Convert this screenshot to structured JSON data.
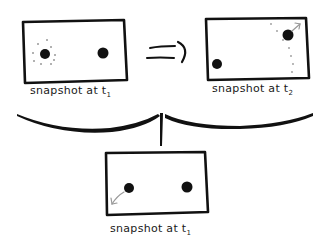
{
  "diagram": {
    "panels": [
      {
        "id": "top-left",
        "label_prefix": "snapshot at t",
        "label_subscript": "1",
        "description": "two dots; left dot surrounded by a dotted circle of possible positions"
      },
      {
        "id": "top-right",
        "label_prefix": "snapshot at t",
        "label_subscript": "2",
        "description": "one dot bottom-left, one dot top-right with gray arrow pointing up-right and dotted trail"
      },
      {
        "id": "bottom",
        "label_prefix": "snapshot at t",
        "label_subscript": "1",
        "description": "two dots; gray arrow from left dot pointing down-left"
      }
    ],
    "connectors": {
      "implies_symbol": "=>",
      "brace": "curly brace joining top panels into bottom panel"
    },
    "colors": {
      "ink": "#111111",
      "gray_annotation": "#9a9a9a",
      "background": "#ffffff"
    }
  }
}
